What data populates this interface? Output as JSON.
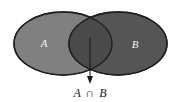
{
  "figure": {
    "background_color": "#ffffff",
    "width": 181,
    "height": 102
  },
  "sets": {
    "left": {
      "label": "A",
      "fill_color": "#808080",
      "stroke_color": "#1f1f1f",
      "cx": 63,
      "cy": 43.5,
      "rx": 49,
      "ry": 31.5
    },
    "right": {
      "label": "B",
      "fill_color": "#555555",
      "stroke_color": "#1f1f1f",
      "cx": 118,
      "cy": 43.5,
      "rx": 49,
      "ry": 31.5
    },
    "intersection": {
      "fill_color": "#4a4a4a"
    }
  },
  "annotation": {
    "caption_left_operand": "A",
    "caption_operator": "∩",
    "caption_right_operand": "B",
    "caption_full": "A ∩ B",
    "arrow_color": "#1a1a1a",
    "arrow_start_y": 38,
    "arrow_end_y": 82,
    "arrow_x": 90
  }
}
